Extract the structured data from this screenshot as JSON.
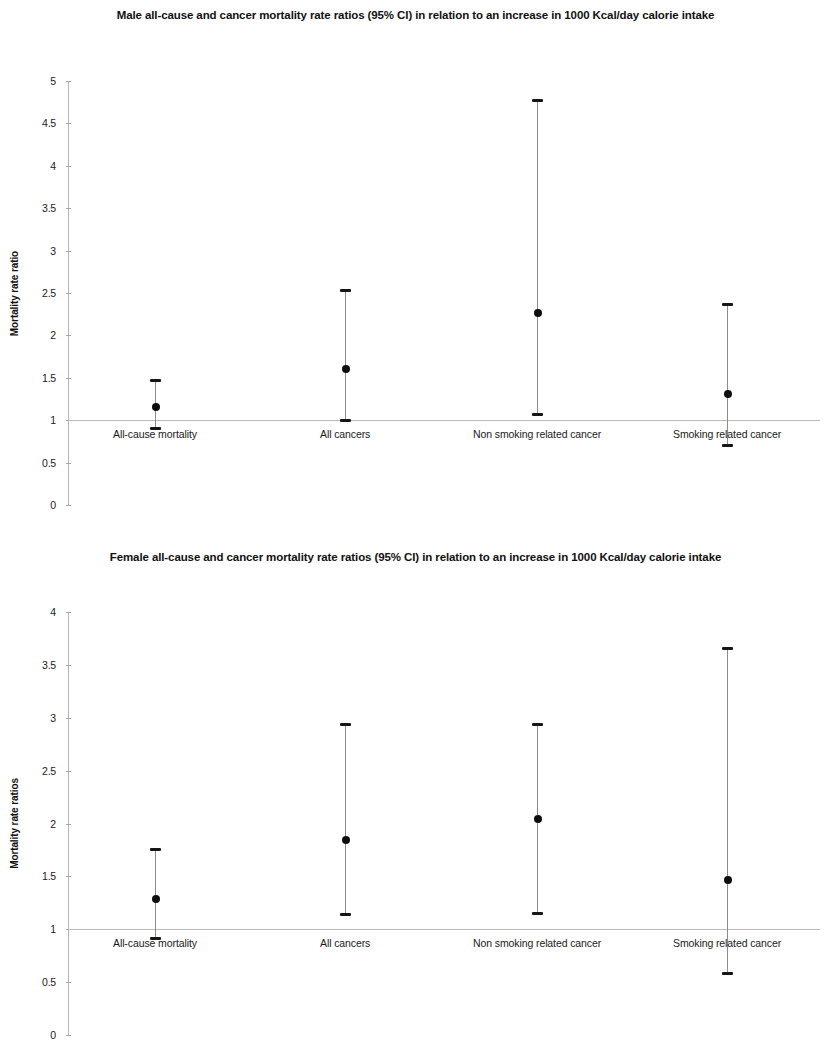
{
  "figure": {
    "background_color": "#ffffff",
    "marker_color": "#0d0d0d",
    "axis_color": "#b8b6b2"
  },
  "charts": {
    "male": {
      "title": "Male all-cause and cancer mortality rate ratios (95% CI) in relation to an increase in 1000 Kcal/day calorie intake",
      "ylabel": "Mortality rate ratio",
      "yticks": [
        "0",
        "0.5",
        "1",
        "1.5",
        "2",
        "2.5",
        "3",
        "3.5",
        "4",
        "4.5",
        "5"
      ],
      "categories": [
        "All-cause mortality",
        "All cancers",
        "Non smoking related cancer",
        "Smoking related cancer"
      ]
    },
    "female": {
      "title": "Female all-cause and cancer mortality rate ratios (95% CI) in relation to an increase in 1000 Kcal/day calorie intake",
      "ylabel": "Mortality rate ratios",
      "yticks": [
        "0",
        "0.5",
        "1",
        "1.5",
        "2",
        "2.5",
        "3",
        "3.5",
        "4"
      ],
      "categories": [
        "All-cause mortality",
        "All cancers",
        "Non smoking related cancer",
        "Smoking related cancer"
      ]
    }
  },
  "chart_data": [
    {
      "type": "scatter",
      "subtype": "forest-plot-error-bars",
      "title": "Male all-cause and cancer mortality rate ratios (95% CI) in relation to an increase in 1000 Kcal/day calorie intake",
      "xlabel": "",
      "ylabel": "Mortality rate ratio",
      "ylim": [
        0,
        5
      ],
      "ytick_step": 0.5,
      "yticks": [
        0,
        0.5,
        1,
        1.5,
        2,
        2.5,
        3,
        3.5,
        4,
        4.5,
        5
      ],
      "grid": false,
      "legend": "none",
      "reference_line": 1,
      "categories": [
        "All-cause mortality",
        "All cancers",
        "Non smoking related cancer",
        "Smoking related cancer"
      ],
      "values": [
        1.15,
        1.6,
        2.27,
        1.31
      ],
      "ci_lower": [
        0.91,
        1.0,
        1.07,
        0.71
      ],
      "ci_upper": [
        1.47,
        2.54,
        4.78,
        2.37
      ]
    },
    {
      "type": "scatter",
      "subtype": "forest-plot-error-bars",
      "title": "Female all-cause and cancer mortality rate ratios (95% CI) in relation to an increase in 1000 Kcal/day calorie intake",
      "xlabel": "",
      "ylabel": "Mortality rate ratios",
      "ylim": [
        0,
        4
      ],
      "ytick_step": 0.5,
      "yticks": [
        0,
        0.5,
        1,
        1.5,
        2,
        2.5,
        3,
        3.5,
        4
      ],
      "grid": false,
      "legend": "none",
      "reference_line": 1,
      "categories": [
        "All-cause mortality",
        "All cancers",
        "Non smoking related cancer",
        "Smoking related cancer"
      ],
      "values": [
        1.29,
        1.84,
        2.04,
        1.47
      ],
      "ci_lower": [
        0.92,
        1.14,
        1.15,
        0.59
      ],
      "ci_upper": [
        1.76,
        2.94,
        2.94,
        3.66
      ]
    }
  ]
}
